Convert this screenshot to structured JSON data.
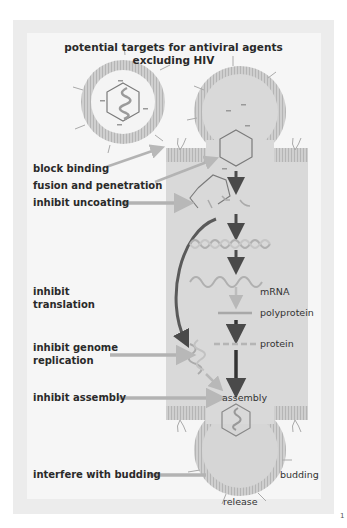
{
  "title": {
    "line1": "potential targets for antiviral agents",
    "line2_prefix": "excluding ",
    "line2_bold": "HIV"
  },
  "targets": [
    {
      "id": "block-binding",
      "label": "block binding"
    },
    {
      "id": "fusion-penetration",
      "label": "fusion and penetration"
    },
    {
      "id": "inhibit-uncoating",
      "label": "inhibit uncoating"
    },
    {
      "id": "inhibit-translation",
      "label_line1": "inhibit",
      "label_line2": "translation"
    },
    {
      "id": "inhibit-genome-replication",
      "label_line1": "inhibit genome",
      "label_line2": "replication"
    },
    {
      "id": "inhibit-assembly",
      "label": "inhibit assembly"
    },
    {
      "id": "interfere-budding",
      "label": "interfere with budding"
    }
  ],
  "stages": {
    "mrna": "mRNA",
    "polyprotein": "polyprotein",
    "protein": "protein",
    "assembly": "assembly",
    "budding": "budding",
    "release": "release"
  },
  "page_mark": "1",
  "colors": {
    "background": "#ffffff",
    "frame": "#ececec",
    "panel": "#f6f6f6",
    "cell": "#d9d9d9",
    "membrane": "#c4c4c4",
    "arrow_dark": "#4a4a4a",
    "arrow_light": "#b3b3b3",
    "text": "#2a2a2a"
  }
}
